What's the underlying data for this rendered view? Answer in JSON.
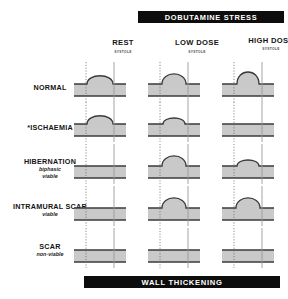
{
  "figure": {
    "top_banner": "DOBUTAMINE  STRESS",
    "bottom_banner": "WALL THICKENING",
    "systole_label": "SYSTOLE"
  },
  "columns": [
    {
      "id": "rest",
      "label": "REST",
      "sub": "SYSTOLE"
    },
    {
      "id": "low-dose",
      "label": "LOW DOSE",
      "sub": "SYSTOLE"
    },
    {
      "id": "high-dose",
      "label": "HIGH DOSE",
      "sub": "SYSTOLE"
    }
  ],
  "rows": [
    {
      "id": "normal",
      "label": "NORMAL",
      "sub1": "",
      "sub2": "",
      "cells": [
        {
          "column": "rest",
          "bulge": "medium"
        },
        {
          "column": "low-dose",
          "bulge": "large"
        },
        {
          "column": "high-dose",
          "bulge": "extra-large"
        }
      ]
    },
    {
      "id": "ischaemia",
      "label": "*ISCHAEMIA",
      "sub1": "",
      "sub2": "",
      "cells": [
        {
          "column": "rest",
          "bulge": "medium"
        },
        {
          "column": "low-dose",
          "bulge": "small"
        },
        {
          "column": "high-dose",
          "bulge": "flat"
        }
      ]
    },
    {
      "id": "hibernation",
      "label": "HIBERNATION",
      "sub1": "biphasic",
      "sub2": "viable",
      "cells": [
        {
          "column": "rest",
          "bulge": "flat"
        },
        {
          "column": "low-dose",
          "bulge": "large"
        },
        {
          "column": "high-dose",
          "bulge": "small"
        }
      ]
    },
    {
      "id": "intramural-scar",
      "label": "INTRAMURAL SCAR",
      "sub1": "viable",
      "sub2": "",
      "cells": [
        {
          "column": "rest",
          "bulge": "flat"
        },
        {
          "column": "low-dose",
          "bulge": "large"
        },
        {
          "column": "high-dose",
          "bulge": "large"
        }
      ]
    },
    {
      "id": "scar",
      "label": "SCAR",
      "sub1": "non-viable",
      "sub2": "",
      "cells": [
        {
          "column": "rest",
          "bulge": "flat"
        },
        {
          "column": "low-dose",
          "bulge": "flat"
        },
        {
          "column": "high-dose",
          "bulge": "flat"
        }
      ]
    }
  ],
  "colors": {
    "banner_background": "#0d0d0d",
    "banner_text": "#ffffff",
    "wall_fill": "#c9c9c9",
    "wall_outline": "#3a3a3a",
    "guide_dotted": "#6f6f6f",
    "guide_solid": "#9a9a9a",
    "text": "#141414"
  },
  "layout": {
    "column_x": [
      100,
      174,
      248
    ],
    "row_y": [
      62,
      102,
      144,
      186,
      228
    ],
    "cell_width": 56,
    "cell_height": 40
  }
}
